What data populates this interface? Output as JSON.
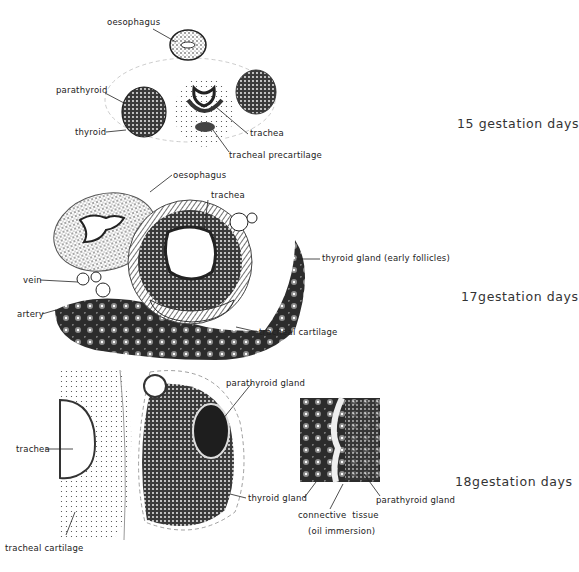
{
  "figure": {
    "panels": [
      {
        "id": "day15",
        "stage_label": "15 gestation days",
        "labels": {
          "oesophagus": "oesophagus",
          "parathyroid": "parathyroid",
          "thyroid": "thyroid",
          "trachea": "trachea",
          "tracheal_precartilage": "tracheal precartilage"
        }
      },
      {
        "id": "day17",
        "stage_label": "17gestation days",
        "labels": {
          "oesophagus": "oesophagus",
          "trachea": "trachea",
          "thyroid_gland": "thyroid gland (early follicles)",
          "vein": "vein",
          "artery": "artery",
          "tracheal_cartilage": "tracheal cartilage"
        }
      },
      {
        "id": "day18",
        "stage_label": "18gestation days",
        "labels": {
          "parathyroid_gland": "parathyroid gland",
          "trachea": "trachea",
          "thyroid_gland": "thyroid gland",
          "tracheal_cartilage": "tracheal cartilage",
          "inset_parathyroid_gland": "parathyroid gland",
          "connective_tissue": "connective  tissue",
          "oil_immersion": "(oil immersion)"
        }
      }
    ]
  },
  "colors": {
    "ink": "#222222",
    "tissue_dark": "#2a2a2a",
    "tissue_mid": "#6a6a6a",
    "tissue_light": "#bdbdbd",
    "background": "#ffffff"
  }
}
